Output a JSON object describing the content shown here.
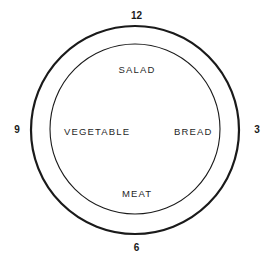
{
  "diagram": {
    "kind": "plate-clock-diagram",
    "background_color": "#ffffff",
    "stroke_color": "#1a1a1a",
    "rim": {
      "outer_circle": {
        "center_x": 135,
        "center_y": 130,
        "radius": 104,
        "stroke_width": 2.2
      },
      "inner_circle": {
        "center_x": 135,
        "center_y": 129,
        "radius": 85,
        "stroke_width": 1.1
      }
    },
    "clock_positions": [
      {
        "name": "twelve",
        "label": "12",
        "position": "top"
      },
      {
        "name": "three",
        "label": "3",
        "position": "right"
      },
      {
        "name": "six",
        "label": "6",
        "position": "bottom"
      },
      {
        "name": "nine",
        "label": "9",
        "position": "left"
      }
    ],
    "food_sections": [
      {
        "name": "salad",
        "label": "SALAD",
        "position": "top"
      },
      {
        "name": "bread",
        "label": "BREAD",
        "position": "right"
      },
      {
        "name": "meat",
        "label": "MEAT",
        "position": "bottom"
      },
      {
        "name": "vegetable",
        "label": "VEGETABLE",
        "position": "left"
      }
    ]
  }
}
